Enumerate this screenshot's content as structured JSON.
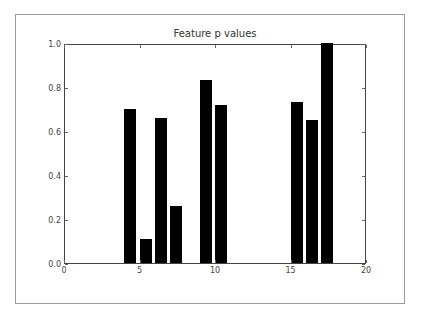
{
  "chart_data": {
    "type": "bar",
    "title": "Feature p values",
    "xlabel": "",
    "ylabel": "",
    "x": [
      4,
      5,
      6,
      7,
      9,
      10,
      15,
      16,
      17
    ],
    "values": [
      0.7,
      0.11,
      0.66,
      0.26,
      0.83,
      0.72,
      0.73,
      0.65,
      1.0
    ],
    "bar_width": 0.8,
    "bar_color": "#000000",
    "xlim": [
      0,
      20
    ],
    "ylim": [
      0.0,
      1.0
    ],
    "xticks": [
      "0",
      "5",
      "10",
      "15",
      "20"
    ],
    "yticks": [
      "0.0",
      "0.2",
      "0.4",
      "0.6",
      "0.8",
      "1.0"
    ],
    "grid": false,
    "legend": null
  }
}
